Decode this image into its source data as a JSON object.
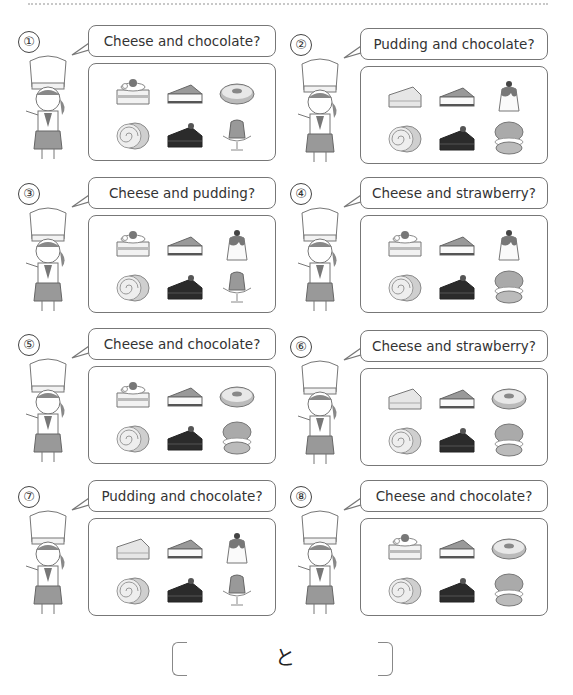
{
  "worksheet": {
    "answer_connector": "と",
    "panels": [
      {
        "number": "①",
        "question": "Cheese and chocolate?",
        "items": [
          "strawberry-shortcake",
          "cheesecake",
          "donut",
          "swiss-roll",
          "chocolate-cake",
          "jelly-pudding"
        ]
      },
      {
        "number": "②",
        "question": "Pudding and chocolate?",
        "items": [
          "sponge-cake",
          "cheesecake",
          "custard-pudding",
          "swiss-roll",
          "chocolate-cake",
          "cream-puff"
        ]
      },
      {
        "number": "③",
        "question": "Cheese and pudding?",
        "items": [
          "strawberry-shortcake",
          "cheesecake",
          "custard-pudding",
          "swiss-roll",
          "chocolate-cake",
          "jelly-pudding"
        ]
      },
      {
        "number": "④",
        "question": "Cheese and strawberry?",
        "items": [
          "strawberry-shortcake",
          "cheesecake",
          "custard-pudding",
          "swiss-roll",
          "chocolate-cake",
          "cream-puff"
        ]
      },
      {
        "number": "⑤",
        "question": "Cheese and chocolate?",
        "items": [
          "strawberry-shortcake",
          "cheesecake",
          "donut",
          "swiss-roll",
          "chocolate-cake",
          "cream-puff"
        ]
      },
      {
        "number": "⑥",
        "question": "Cheese and strawberry?",
        "items": [
          "sponge-cake",
          "cheesecake",
          "donut",
          "swiss-roll",
          "chocolate-cake",
          "cream-puff"
        ]
      },
      {
        "number": "⑦",
        "question": "Pudding and chocolate?",
        "items": [
          "sponge-cake",
          "cheesecake",
          "custard-pudding",
          "swiss-roll",
          "chocolate-cake",
          "jelly-pudding"
        ]
      },
      {
        "number": "⑧",
        "question": "Cheese and chocolate?",
        "items": [
          "strawberry-shortcake",
          "cheesecake",
          "donut",
          "swiss-roll",
          "chocolate-cake",
          "cream-puff"
        ]
      }
    ]
  },
  "colors": {
    "line": "#777777",
    "text": "#333333",
    "dark": "#2b2b2b",
    "mid": "#9a9a9a",
    "light": "#d6d6d6"
  }
}
